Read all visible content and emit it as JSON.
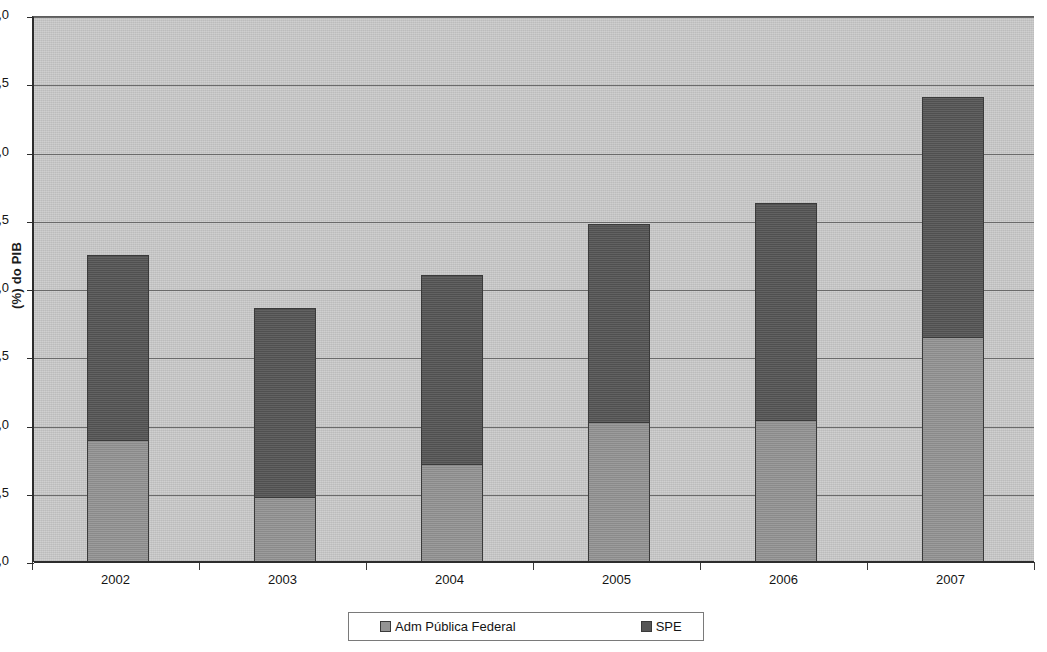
{
  "chart_data": {
    "type": "bar",
    "subtype": "stacked-vertical",
    "title": "",
    "xlabel": "",
    "ylabel": "(%) do PIB",
    "categories": [
      "2002",
      "2003",
      "2004",
      "2005",
      "2006",
      "2007"
    ],
    "series": [
      {
        "name": "Adm Pública  Federal",
        "color": "#949494",
        "values": [
          0.89,
          0.47,
          0.71,
          1.02,
          1.03,
          1.64
        ]
      },
      {
        "name": "SPE",
        "color": "#565656",
        "values": [
          1.36,
          1.39,
          1.39,
          1.46,
          1.6,
          1.77
        ]
      }
    ],
    "totals": [
      2.25,
      1.86,
      2.1,
      2.48,
      2.63,
      3.41
    ],
    "ylim": [
      0.0,
      4.0
    ],
    "ytick_step": 0.5,
    "ytick_labels": [
      "0,0",
      "0,5",
      "1,0",
      "1,5",
      "2,0",
      "2,5",
      "3,0",
      "3,5",
      "4,0"
    ],
    "ytick_values": [
      0.0,
      0.5,
      1.0,
      1.5,
      2.0,
      2.5,
      3.0,
      3.5,
      4.0
    ],
    "grid": true,
    "grid_axis": "y",
    "legend_position": "bottom",
    "legend_entries": [
      "Adm Pública  Federal",
      "SPE"
    ],
    "decimal_separator": ",",
    "plot_background": "#c9c9c9",
    "axis_color": "#2d2d2d",
    "gridline_color": "#6a6a6a"
  }
}
